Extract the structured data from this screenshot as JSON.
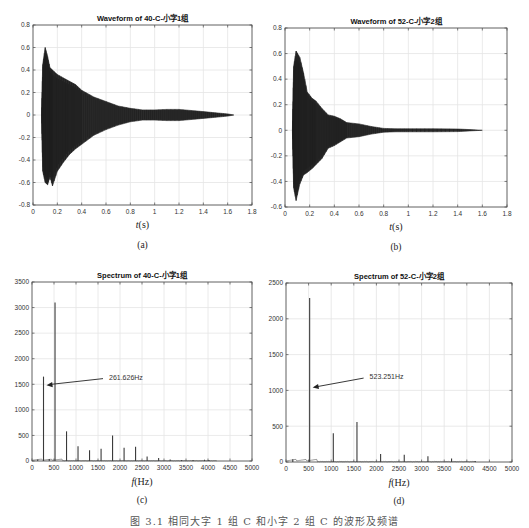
{
  "figure_caption": "图 3.1  相同大字 1 组 C 和小字 2 组 C 的波形及频谱",
  "chart_data": [
    {
      "id": "a",
      "type": "area",
      "title": "Waveform of 40-C-小字1组",
      "xlabel": "t(s)",
      "xlabel_italic": "t",
      "xlabel_rest": "(s)",
      "ylabel": "",
      "sublabel": "(a)",
      "xlim": [
        0,
        1.8
      ],
      "ylim": [
        -0.8,
        0.8
      ],
      "xticks": [
        0,
        0.2,
        0.4,
        0.6,
        0.8,
        1,
        1.2,
        1.4,
        1.6,
        1.8
      ],
      "yticks": [
        -0.8,
        -0.6,
        -0.4,
        -0.2,
        0,
        0.2,
        0.4,
        0.6,
        0.8
      ],
      "grid": true,
      "envelope": {
        "x": [
          0.07,
          0.08,
          0.1,
          0.12,
          0.14,
          0.16,
          0.2,
          0.25,
          0.3,
          0.35,
          0.4,
          0.5,
          0.6,
          0.7,
          0.8,
          0.9,
          1.0,
          1.1,
          1.2,
          1.3,
          1.4,
          1.5,
          1.6,
          1.65
        ],
        "upper": [
          0.0,
          0.45,
          0.6,
          0.52,
          0.42,
          0.4,
          0.36,
          0.33,
          0.3,
          0.27,
          0.22,
          0.16,
          0.12,
          0.08,
          0.06,
          0.045,
          0.045,
          0.05,
          0.05,
          0.04,
          0.03,
          0.02,
          0.01,
          0.0
        ],
        "lower": [
          0.0,
          -0.5,
          -0.6,
          -0.62,
          -0.55,
          -0.63,
          -0.5,
          -0.42,
          -0.35,
          -0.3,
          -0.26,
          -0.18,
          -0.13,
          -0.09,
          -0.06,
          -0.045,
          -0.045,
          -0.05,
          -0.05,
          -0.04,
          -0.03,
          -0.02,
          -0.01,
          0.0
        ]
      }
    },
    {
      "id": "b",
      "type": "area",
      "title": "Waveform of 52-C-小字2组",
      "xlabel": "t(s)",
      "xlabel_italic": "t",
      "xlabel_rest": "(s)",
      "ylabel": "",
      "sublabel": "(b)",
      "xlim": [
        0,
        1.8
      ],
      "ylim": [
        -0.6,
        0.8
      ],
      "xticks": [
        0,
        0.2,
        0.4,
        0.6,
        0.8,
        1,
        1.2,
        1.4,
        1.6,
        1.8
      ],
      "yticks": [
        -0.6,
        -0.4,
        -0.2,
        0,
        0.2,
        0.4,
        0.6,
        0.8
      ],
      "grid": true,
      "envelope": {
        "x": [
          0.06,
          0.07,
          0.09,
          0.12,
          0.15,
          0.18,
          0.22,
          0.25,
          0.3,
          0.35,
          0.4,
          0.45,
          0.5,
          0.6,
          0.7,
          0.8,
          0.9,
          1.0,
          1.2,
          1.4,
          1.5,
          1.6
        ],
        "upper": [
          0.0,
          0.5,
          0.62,
          0.57,
          0.45,
          0.3,
          0.25,
          0.23,
          0.17,
          0.12,
          0.11,
          0.09,
          0.06,
          0.05,
          0.03,
          0.015,
          0.012,
          0.012,
          0.012,
          0.01,
          0.005,
          0.0
        ],
        "lower": [
          0.0,
          -0.45,
          -0.55,
          -0.42,
          -0.35,
          -0.33,
          -0.3,
          -0.27,
          -0.22,
          -0.14,
          -0.12,
          -0.09,
          -0.06,
          -0.05,
          -0.03,
          -0.015,
          -0.012,
          -0.012,
          -0.012,
          -0.01,
          -0.005,
          0.0
        ]
      }
    },
    {
      "id": "c",
      "type": "line",
      "title": "Spectrum of 40-C-小字1组",
      "xlabel": "f(Hz)",
      "xlabel_italic": "f",
      "xlabel_rest": "(Hz)",
      "ylabel": "",
      "sublabel": "(c)",
      "xlim": [
        0,
        5000
      ],
      "ylim": [
        0,
        3500
      ],
      "xticks": [
        0,
        500,
        1000,
        1500,
        2000,
        2500,
        3000,
        3500,
        4000,
        4500,
        5000
      ],
      "yticks": [
        0,
        500,
        1000,
        1500,
        2000,
        2500,
        3000,
        3500
      ],
      "grid": true,
      "annotation": {
        "text": "261.626Hz",
        "x": 261.626,
        "y": 1480,
        "text_x": 1750,
        "text_y": 1650
      },
      "peaks": {
        "x": [
          130,
          261.6,
          392,
          523.3,
          785,
          1046,
          1308,
          1570,
          1831,
          2093,
          2354,
          2616,
          2878,
          3140,
          3400,
          3660,
          3920,
          4020
        ],
        "values": [
          30,
          1650,
          40,
          3100,
          580,
          290,
          210,
          240,
          500,
          260,
          280,
          90,
          60,
          30,
          20,
          20,
          25,
          20
        ]
      }
    },
    {
      "id": "d",
      "type": "line",
      "title": "Spectrum of 52-C-小字2组",
      "xlabel": "f(Hz)",
      "xlabel_italic": "f",
      "xlabel_rest": "(Hz)",
      "ylabel": "",
      "sublabel": "(d)",
      "xlim": [
        0,
        5000
      ],
      "ylim": [
        0,
        2500
      ],
      "xticks": [
        0,
        500,
        1000,
        1500,
        2000,
        2500,
        3000,
        3500,
        4000,
        4500,
        5000
      ],
      "yticks": [
        0,
        500,
        1000,
        1500,
        2000,
        2500
      ],
      "grid": true,
      "annotation": {
        "text": "523.251Hz",
        "x": 523.251,
        "y": 1040,
        "text_x": 1850,
        "text_y": 1200
      },
      "peaks": {
        "x": [
          150,
          523.3,
          1046.5,
          1570,
          2093,
          2616,
          3140,
          3663,
          4186
        ],
        "values": [
          40,
          2290,
          400,
          560,
          110,
          100,
          80,
          50,
          15
        ]
      }
    }
  ],
  "layout": {
    "panels": [
      {
        "id": "a",
        "plot": {
          "left": 33,
          "top": 25,
          "right": 252,
          "bottom": 205
        },
        "title_y": 18,
        "xlabel_y": 228,
        "sublabel_y": 248
      },
      {
        "id": "b",
        "plot": {
          "left": 285,
          "top": 28,
          "right": 507,
          "bottom": 207
        },
        "title_y": 21,
        "xlabel_y": 230,
        "sublabel_y": 250
      },
      {
        "id": "c",
        "plot": {
          "left": 32,
          "top": 282,
          "right": 252,
          "bottom": 461
        },
        "title_y": 275,
        "xlabel_y": 485,
        "sublabel_y": 503
      },
      {
        "id": "d",
        "plot": {
          "left": 286,
          "top": 283,
          "right": 512,
          "bottom": 462
        },
        "title_y": 276,
        "xlabel_y": 486,
        "sublabel_y": 504
      }
    ],
    "colors": {
      "trace": "#2b2b2b",
      "grid": "#e4e4e4",
      "axis": "#4a4a4a",
      "text": "#333333"
    }
  }
}
